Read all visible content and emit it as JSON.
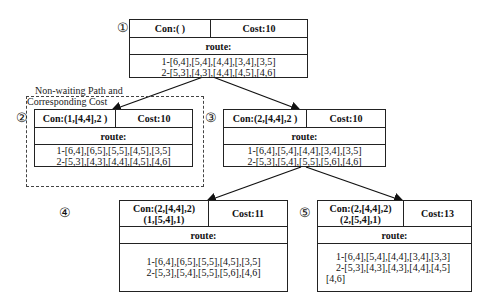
{
  "diagram": {
    "annotation": {
      "line1": "Non-waiting Path and",
      "line2": "Corresponding Cost"
    },
    "nodes": [
      {
        "id": "1",
        "marker": "①",
        "con": [
          "Con:( )"
        ],
        "cost": "Cost:10",
        "route_label": "route:",
        "routes": [
          "1-[6,4],[5,4],[4,4],[3,4],[3,5]",
          "2-[5,3],[4,3],[4,4],[4,5],[4,6]"
        ]
      },
      {
        "id": "2",
        "marker": "②",
        "con": [
          "Con:(1,[4,4],2 )"
        ],
        "cost": "Cost:10",
        "route_label": "route:",
        "routes": [
          "1-[6,4],[6,5],[5,5],[4,5],[3,5]",
          "2-[5,3],[4,3],[4,4],[4,5],[4,6]"
        ]
      },
      {
        "id": "3",
        "marker": "③",
        "con": [
          "Con:(2,[4,4],2 )"
        ],
        "cost": "Cost:10",
        "route_label": "route:",
        "routes": [
          "1-[6,4],[5,4],[4,4],[3,4],[3,5]",
          "2-[5,3],[5,4],[5,5],[5,6],[4,6]"
        ]
      },
      {
        "id": "4",
        "marker": "④",
        "con": [
          "Con:(2,[4,4],2)",
          "(1,[5,4],1)"
        ],
        "cost": "Cost:11",
        "route_label": "route:",
        "routes": [
          "1-[6,4],[6,5],[5,5],[4,5],[3,5]",
          "2-[5,3],[5,4],[5,5],[5,6],[4,6]"
        ]
      },
      {
        "id": "5",
        "marker": "⑤",
        "con": [
          "Con:(2,[4,4],2)",
          "(2,[5,4],1)"
        ],
        "cost": "Cost:13",
        "route_label": "route:",
        "routes": [
          "1-[6,4],[5,4],[4,4],[3,4],[3,3]",
          "2-[5,3],[4,3],[4,3],[4,4],[4,5]",
          "[4,6]"
        ]
      }
    ],
    "edges": [
      {
        "from": "1",
        "to": "2"
      },
      {
        "from": "1",
        "to": "3"
      },
      {
        "from": "3",
        "to": "4"
      },
      {
        "from": "3",
        "to": "5"
      }
    ]
  }
}
